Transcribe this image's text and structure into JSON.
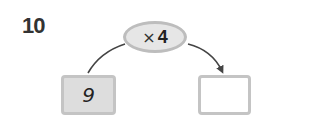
{
  "problem": {
    "number": "10",
    "operation": {
      "symbol": "×",
      "operand": "4"
    },
    "input_value": "9",
    "output_value": ""
  },
  "colors": {
    "box_border": "#c4c4c4",
    "input_fill": "#dddddd",
    "oval_fill": "#e6e6e6",
    "arrow": "#444444"
  }
}
